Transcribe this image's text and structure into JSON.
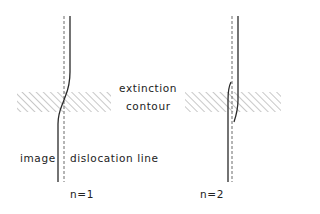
{
  "labels": {
    "extinction": "extinction",
    "contour": "contour",
    "image": "image",
    "dislocation_line": "dislocation  line",
    "n1": "n=1",
    "n2": "n=2"
  },
  "panels": [
    {
      "id": "n1",
      "description": "single image line crossing dislocation at extinction contour"
    },
    {
      "id": "n2",
      "description": "image line splits with arcs at extinction contour"
    }
  ],
  "colors": {
    "line": "#2a2a2a",
    "dashed": "#6a6a6a",
    "hatch": "#9a9a9a"
  }
}
